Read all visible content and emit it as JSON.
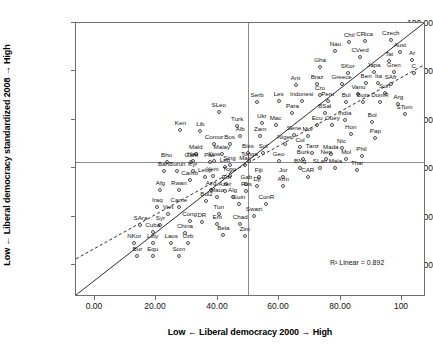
{
  "chart_data": {
    "type": "scatter",
    "title": "",
    "xlabel": "Low ← Liberal democracy 2000 → High",
    "ylabel": "Low ← Liberal democracy standardized 2008 → High",
    "xlim": [
      -6,
      108
    ],
    "ylim": [
      -6,
      108
    ],
    "xticks": [
      "0.00",
      "20.00",
      "40.00",
      "60.00",
      "80.00",
      "100"
    ],
    "xtick_values": [
      0,
      20,
      40,
      60,
      80,
      100
    ],
    "yticks": [
      "0.00",
      "20.00",
      "40.00",
      "60.00",
      "80.00",
      "100.00"
    ],
    "ytick_values": [
      0,
      20,
      40,
      60,
      80,
      100
    ],
    "grid": false,
    "legend": null,
    "annotation": "R² Linear = 0.892",
    "annotation_value": 0.892,
    "reference_lines": {
      "horizontal_at_y": 50,
      "vertical_at_x": 50,
      "identity_line": "y = x (solid)",
      "fit_line": "linear regression (dashed)"
    },
    "marker": "open-circle",
    "points": [
      {
        "label": "Czech",
        "x": 96.5,
        "y": 101.0
      },
      {
        "label": "Aust",
        "x": 99.5,
        "y": 96.0
      },
      {
        "label": "CRica",
        "x": 88.0,
        "y": 100.5
      },
      {
        "label": "Chil",
        "x": 83.0,
        "y": 100.0
      },
      {
        "label": "Nau",
        "x": 78.5,
        "y": 96.5
      },
      {
        "label": "CVerd",
        "x": 86.5,
        "y": 94.0
      },
      {
        "label": "Ar",
        "x": 103.5,
        "y": 92.5
      },
      {
        "label": "Tai",
        "x": 96.0,
        "y": 92.0
      },
      {
        "label": "Gren",
        "x": 97.5,
        "y": 87.5
      },
      {
        "label": "C",
        "x": 104.0,
        "y": 87.0
      },
      {
        "label": "Japa",
        "x": 91.0,
        "y": 87.5
      },
      {
        "label": "SKor",
        "x": 82.5,
        "y": 87.0
      },
      {
        "label": "Gha",
        "x": 73.5,
        "y": 89.5
      },
      {
        "label": "SAfr",
        "x": 96.5,
        "y": 82.5
      },
      {
        "label": "Ita",
        "x": 92.5,
        "y": 83.0
      },
      {
        "label": "Ben",
        "x": 88.5,
        "y": 83.0
      },
      {
        "label": "Greece",
        "x": 80.5,
        "y": 82.5
      },
      {
        "label": "Braz",
        "x": 72.5,
        "y": 82.5
      },
      {
        "label": "Ant",
        "x": 65.5,
        "y": 82.0
      },
      {
        "label": "Suri",
        "x": 94.5,
        "y": 79.0
      },
      {
        "label": "Vanu",
        "x": 86.0,
        "y": 78.5
      },
      {
        "label": "Cro",
        "x": 73.5,
        "y": 78.0
      },
      {
        "label": "Arg",
        "x": 99.0,
        "y": 74.5
      },
      {
        "label": "DomR",
        "x": 93.0,
        "y": 75.0
      },
      {
        "label": "Bots",
        "x": 87.5,
        "y": 75.0
      },
      {
        "label": "Bul",
        "x": 82.0,
        "y": 75.0
      },
      {
        "label": "Peru",
        "x": 76.0,
        "y": 75.5
      },
      {
        "label": "Indonesi",
        "x": 67.5,
        "y": 75.5
      },
      {
        "label": "Les",
        "x": 60.0,
        "y": 75.5
      },
      {
        "label": "Serb",
        "x": 53.0,
        "y": 75.0
      },
      {
        "label": "STom",
        "x": 101.0,
        "y": 70.0
      },
      {
        "label": "BSal",
        "x": 75.0,
        "y": 70.5
      },
      {
        "label": "Para",
        "x": 64.5,
        "y": 70.5
      },
      {
        "label": "SLeo",
        "x": 40.5,
        "y": 71.0
      },
      {
        "label": "Bol",
        "x": 90.5,
        "y": 67.0
      },
      {
        "label": "India",
        "x": 81.5,
        "y": 67.5
      },
      {
        "label": "Guey",
        "x": 77.5,
        "y": 65.5
      },
      {
        "label": "Ecu",
        "x": 72.5,
        "y": 65.5
      },
      {
        "label": "Mac",
        "x": 59.0,
        "y": 65.5
      },
      {
        "label": "Ukr",
        "x": 54.5,
        "y": 66.5
      },
      {
        "label": "Turk",
        "x": 46.5,
        "y": 65.0
      },
      {
        "label": "Ken",
        "x": 28.0,
        "y": 63.5
      },
      {
        "label": "Lib",
        "x": 34.5,
        "y": 63.0
      },
      {
        "label": "Hon",
        "x": 83.5,
        "y": 62.0
      },
      {
        "label": "Pap",
        "x": 91.5,
        "y": 60.0
      },
      {
        "label": "Sene",
        "x": 65.0,
        "y": 61.5
      },
      {
        "label": "Mor",
        "x": 69.5,
        "y": 61.0
      },
      {
        "label": "Zam",
        "x": 54.0,
        "y": 61.0
      },
      {
        "label": "Alb",
        "x": 47.5,
        "y": 61.0
      },
      {
        "label": "Bos",
        "x": 44.0,
        "y": 57.5
      },
      {
        "label": "Comor",
        "x": 39.0,
        "y": 57.5
      },
      {
        "label": "Niger",
        "x": 62.0,
        "y": 57.5
      },
      {
        "label": "Col",
        "x": 67.0,
        "y": 56.5
      },
      {
        "label": "Nic",
        "x": 80.5,
        "y": 56.0
      },
      {
        "label": "Mald",
        "x": 33.0,
        "y": 53.5
      },
      {
        "label": "Malay",
        "x": 41.5,
        "y": 53.5
      },
      {
        "label": "Tanz",
        "x": 71.0,
        "y": 54.0
      },
      {
        "label": "Mada",
        "x": 77.0,
        "y": 53.5
      },
      {
        "label": "Biss",
        "x": 50.0,
        "y": 54.0
      },
      {
        "label": "Sol",
        "x": 55.0,
        "y": 54.0
      },
      {
        "label": "Phil",
        "x": 87.0,
        "y": 52.5
      },
      {
        "label": "Mol",
        "x": 82.0,
        "y": 51.5
      },
      {
        "label": "Nep",
        "x": 75.5,
        "y": 51.5
      },
      {
        "label": "Burk",
        "x": 68.0,
        "y": 51.5
      },
      {
        "label": "Hait",
        "x": 32.0,
        "y": 50.5
      },
      {
        "label": "Kuw",
        "x": 39.0,
        "y": 50.5
      },
      {
        "label": "Tonga",
        "x": 50.5,
        "y": 50.5
      },
      {
        "label": "Geo",
        "x": 60.0,
        "y": 50.5
      },
      {
        "label": "Sing",
        "x": 44.0,
        "y": 49.0
      },
      {
        "label": "Mali",
        "x": 49.0,
        "y": 49.0
      },
      {
        "label": "BNg",
        "x": 67.0,
        "y": 47.5
      },
      {
        "label": "SLan",
        "x": 73.5,
        "y": 47.5
      },
      {
        "label": "Mala",
        "x": 78.5,
        "y": 47.5
      },
      {
        "label": "Thai",
        "x": 85.5,
        "y": 47.0
      },
      {
        "label": "Bhu",
        "x": 23.5,
        "y": 50.0
      },
      {
        "label": "Gam",
        "x": 31.5,
        "y": 50.0
      },
      {
        "label": "Pak",
        "x": 37.5,
        "y": 50.0
      },
      {
        "label": "Leb",
        "x": 42.5,
        "y": 48.0
      },
      {
        "label": "Bah",
        "x": 22.5,
        "y": 46.5
      },
      {
        "label": "Burun",
        "x": 27.0,
        "y": 46.5
      },
      {
        "label": "Kyr",
        "x": 32.0,
        "y": 46.5
      },
      {
        "label": "Yem",
        "x": 38.5,
        "y": 44.5
      },
      {
        "label": "Togo",
        "x": 44.0,
        "y": 44.5
      },
      {
        "label": "Lebp",
        "x": 36.0,
        "y": 44.0
      },
      {
        "label": "Fiji",
        "x": 53.5,
        "y": 44.0
      },
      {
        "label": "Jor",
        "x": 61.5,
        "y": 44.0
      },
      {
        "label": "CAR",
        "x": 69.5,
        "y": 44.0
      },
      {
        "label": "Camb",
        "x": 31.0,
        "y": 42.5
      },
      {
        "label": "Eth",
        "x": 43.0,
        "y": 41.0
      },
      {
        "label": "Gab",
        "x": 49.5,
        "y": 41.0
      },
      {
        "label": "Dji",
        "x": 53.0,
        "y": 40.0
      },
      {
        "label": "Arm",
        "x": 61.5,
        "y": 40.0
      },
      {
        "label": "Afg",
        "x": 21.5,
        "y": 38.5
      },
      {
        "label": "Rwan",
        "x": 27.5,
        "y": 38.5
      },
      {
        "label": "Azg",
        "x": 38.0,
        "y": 38.5
      },
      {
        "label": "Azer",
        "x": 42.5,
        "y": 38.0
      },
      {
        "label": "Rus",
        "x": 49.5,
        "y": 38.0
      },
      {
        "label": "Alg",
        "x": 45.0,
        "y": 35.5
      },
      {
        "label": "Maur",
        "x": 40.0,
        "y": 35.5
      },
      {
        "label": "Bul2",
        "x": 36.5,
        "y": 34.0
      },
      {
        "label": "Guin",
        "x": 47.0,
        "y": 32.5
      },
      {
        "label": "ConR",
        "x": 56.0,
        "y": 32.5
      },
      {
        "label": "Iraq",
        "x": 20.5,
        "y": 31.5
      },
      {
        "label": "Came",
        "x": 27.5,
        "y": 31.5
      },
      {
        "label": "Viet",
        "x": 24.0,
        "y": 28.5
      },
      {
        "label": "Tun",
        "x": 40.5,
        "y": 28.5
      },
      {
        "label": "Swazi",
        "x": 52.0,
        "y": 27.5
      },
      {
        "label": "Cong",
        "x": 31.0,
        "y": 25.5
      },
      {
        "label": "DR",
        "x": 35.0,
        "y": 25.0
      },
      {
        "label": "Erit",
        "x": 40.0,
        "y": 24.5
      },
      {
        "label": "Chad",
        "x": 47.5,
        "y": 24.5
      },
      {
        "label": "SAra",
        "x": 15.0,
        "y": 24.0
      },
      {
        "label": "Syr",
        "x": 21.5,
        "y": 24.0
      },
      {
        "label": "Cuba",
        "x": 19.0,
        "y": 21.0
      },
      {
        "label": "China",
        "x": 29.5,
        "y": 20.5
      },
      {
        "label": "Bela",
        "x": 42.0,
        "y": 20.0
      },
      {
        "label": "Zim",
        "x": 49.0,
        "y": 19.5
      },
      {
        "label": "NKor",
        "x": 13.0,
        "y": 16.5
      },
      {
        "label": "Liby",
        "x": 19.0,
        "y": 16.5
      },
      {
        "label": "Laos",
        "x": 25.0,
        "y": 16.5
      },
      {
        "label": "Uzb",
        "x": 30.5,
        "y": 16.5
      },
      {
        "label": "Bur",
        "x": 14.0,
        "y": 11.0
      },
      {
        "label": "Equ",
        "x": 19.0,
        "y": 11.0
      },
      {
        "label": "Som",
        "x": 27.5,
        "y": 11.0
      }
    ]
  }
}
